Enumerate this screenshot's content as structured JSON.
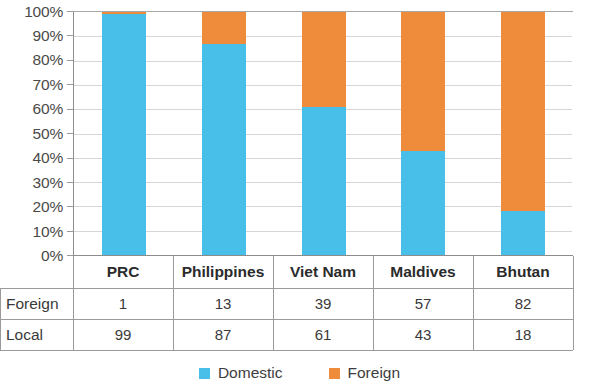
{
  "chart_data": {
    "type": "bar",
    "subtype": "100% stacked column",
    "title": "",
    "xlabel": "",
    "ylabel": "",
    "categories": [
      "PRC",
      "Philippines",
      "Viet Nam",
      "Maldives",
      "Bhutan"
    ],
    "series": [
      {
        "name": "Domestic",
        "key": "Local",
        "color": "#48bfe8",
        "values": [
          99,
          87,
          61,
          43,
          18
        ]
      },
      {
        "name": "Foreign",
        "key": "Foreign",
        "color": "#ef8c3c",
        "values": [
          1,
          13,
          39,
          57,
          82
        ]
      }
    ],
    "stack_order": [
      "Domestic",
      "Foreign"
    ],
    "ylim": [
      0,
      100
    ],
    "ytick_values": [
      0,
      10,
      20,
      30,
      40,
      50,
      60,
      70,
      80,
      90,
      100
    ],
    "ytick_labels": [
      "0%",
      "10%",
      "20%",
      "30%",
      "40%",
      "50%",
      "60%",
      "70%",
      "80%",
      "90%",
      "100%"
    ],
    "grid": true,
    "grid_axis": "y",
    "legend_position": "bottom"
  },
  "table": {
    "header_label": "",
    "columns": [
      "PRC",
      "Philippines",
      "Viet Nam",
      "Maldives",
      "Bhutan"
    ],
    "rows": [
      {
        "label": "Foreign",
        "values": [
          "1",
          "13",
          "39",
          "57",
          "82"
        ]
      },
      {
        "label": "Local",
        "values": [
          "99",
          "87",
          "61",
          "43",
          "18"
        ]
      }
    ]
  },
  "legend": {
    "items": [
      {
        "label": "Domestic",
        "color": "#48bfe8",
        "icon": "legend-square-icon"
      },
      {
        "label": "Foreign",
        "color": "#ef8c3c",
        "icon": "legend-square-icon"
      }
    ]
  }
}
